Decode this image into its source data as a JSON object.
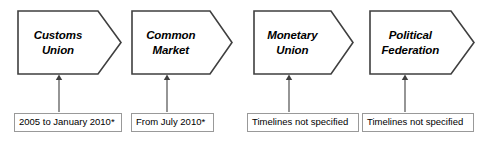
{
  "diagram": {
    "type": "process-chevron-flow",
    "stroke_color": "#3f3f3f",
    "note_border_color": "#999999",
    "background_color": "#ffffff",
    "stages": [
      {
        "id": "customs-union",
        "line1": "Customs",
        "line2": "Union",
        "x": 17,
        "width": 105,
        "note": "2005 to January 2010*",
        "note_x": 14,
        "note_width": 108,
        "connector_x": 58
      },
      {
        "id": "common-market",
        "line1": "Common",
        "line2": "Market",
        "x": 131,
        "width": 102,
        "note": "From July 2010*",
        "note_x": 131,
        "note_width": 83,
        "connector_x": 166
      },
      {
        "id": "monetary-union",
        "line1": "Monetary",
        "line2": "Union",
        "x": 253,
        "width": 101,
        "note": "Timelines not specified",
        "note_x": 247,
        "note_width": 112,
        "connector_x": 288
      },
      {
        "id": "political-federation",
        "line1": "Political",
        "line2": "Federation",
        "x": 369,
        "width": 106,
        "note": "Timelines not specified",
        "note_x": 362,
        "note_width": 112,
        "connector_x": 404
      }
    ]
  }
}
